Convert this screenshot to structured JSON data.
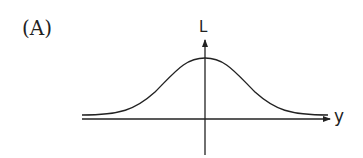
{
  "figure": {
    "panel_label": "(A)",
    "vertical_axis_label": "L",
    "horizontal_axis_label": "y",
    "curve_shape": "bell-curve (gaussian) centered at origin",
    "colors": {
      "ink": "#222222",
      "background": "#ffffff"
    }
  }
}
